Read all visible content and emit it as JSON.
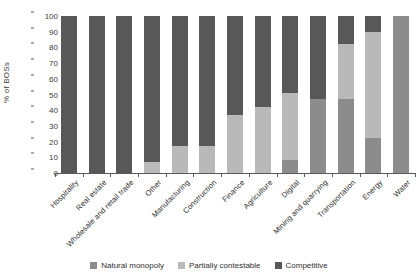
{
  "chart_data": {
    "type": "bar",
    "stacked": true,
    "orientation": "vertical",
    "title": "",
    "subtitle": "",
    "xlabel": "",
    "ylabel": "% of BOSs",
    "ylim": [
      0,
      100
    ],
    "yticks": [
      0,
      10,
      20,
      30,
      40,
      50,
      60,
      70,
      80,
      90,
      100
    ],
    "grid": false,
    "legend_position": "bottom",
    "categories": [
      "Hospitality",
      "Real estate",
      "Wholesale and retail trade",
      "Other",
      "Manufacturing",
      "Construction",
      "Finance",
      "Agriculture",
      "Digital",
      "Mining and quarrying",
      "Transportation",
      "Energy",
      "Water"
    ],
    "series": [
      {
        "name": "Natural monopoly",
        "color": "#8c8c8c",
        "values": [
          0,
          0,
          0,
          0,
          0,
          0,
          0,
          0,
          8,
          47,
          47,
          22,
          100
        ]
      },
      {
        "name": "Partially contestable",
        "color": "#b9b9b9",
        "values": [
          0,
          0,
          0,
          7,
          17,
          17,
          37,
          42,
          43,
          0,
          35,
          68,
          0
        ]
      },
      {
        "name": "Competitive",
        "color": "#585858",
        "values": [
          100,
          100,
          100,
          93,
          83,
          83,
          63,
          58,
          49,
          53,
          18,
          10,
          0
        ]
      }
    ]
  },
  "legend": {
    "items": [
      {
        "label": "Natural monopoly",
        "color": "#8c8c8c"
      },
      {
        "label": "Partially contestable",
        "color": "#b9b9b9"
      },
      {
        "label": "Competitive",
        "color": "#585858"
      }
    ]
  }
}
